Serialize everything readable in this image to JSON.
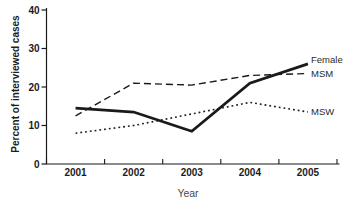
{
  "chart_data": {
    "type": "line",
    "title": "",
    "xlabel": "Year",
    "ylabel": "Percent of interviewed cases",
    "categories": [
      "2001",
      "2002",
      "2003",
      "2004",
      "2005"
    ],
    "series": [
      {
        "name": "Female",
        "values": [
          14.5,
          13.5,
          8.5,
          21,
          26
        ],
        "line_style": "solid",
        "line_width": 2.8
      },
      {
        "name": "MSM",
        "values": [
          12.5,
          21,
          20.5,
          23,
          23.5
        ],
        "line_style": "dashed",
        "line_width": 1.4
      },
      {
        "name": "MSW",
        "values": [
          8,
          10,
          13,
          16,
          13.5
        ],
        "line_style": "dotted",
        "line_width": 1.6
      }
    ],
    "ylim": [
      0,
      40
    ],
    "yticks": [
      0,
      10,
      20,
      30,
      40
    ],
    "grid": false,
    "legend_position": "end-of-line-labels",
    "line_color": "#1a1a1a",
    "axis_color": "#1a1a1a",
    "tick_label_color": "#1c1c1c"
  }
}
